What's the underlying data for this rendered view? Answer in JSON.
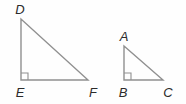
{
  "figure": {
    "background_color": "#fefefe",
    "stroke_color": "#909090",
    "label_color": "#2b2b2b",
    "stroke_width": 1.4,
    "canvas": {
      "width": 186,
      "height": 104
    },
    "triangles": [
      {
        "name": "triangle-DEF",
        "label": "Triangle DEF",
        "right_angle_at": "E",
        "vertices": [
          {
            "id": "D",
            "label": "D",
            "x": 21,
            "y": 19,
            "label_x": 20,
            "label_y": 14,
            "label_anchor": "middle"
          },
          {
            "id": "E",
            "label": "E",
            "x": 21,
            "y": 80,
            "label_x": 20,
            "label_y": 97,
            "label_anchor": "middle"
          },
          {
            "id": "F",
            "label": "F",
            "x": 88,
            "y": 80,
            "label_x": 93,
            "label_y": 97,
            "label_anchor": "middle"
          }
        ],
        "right_angle_marker": {
          "x": 21,
          "y": 80,
          "size": 7
        },
        "points": "21,19 21,80 88,80",
        "legs": {
          "vertical": 61,
          "horizontal": 67
        }
      },
      {
        "name": "triangle-ABC",
        "label": "Triangle ABC",
        "right_angle_at": "B",
        "vertices": [
          {
            "id": "A",
            "label": "A",
            "x": 124,
            "y": 46,
            "label_x": 124,
            "label_y": 41,
            "label_anchor": "middle"
          },
          {
            "id": "B",
            "label": "B",
            "x": 124,
            "y": 80,
            "label_x": 123,
            "label_y": 97,
            "label_anchor": "middle"
          },
          {
            "id": "C",
            "label": "C",
            "x": 163,
            "y": 80,
            "label_x": 168,
            "label_y": 97,
            "label_anchor": "middle"
          }
        ],
        "right_angle_marker": {
          "x": 124,
          "y": 80,
          "size": 7
        },
        "points": "124,46 124,80 163,80",
        "legs": {
          "vertical": 34,
          "horizontal": 39
        }
      }
    ]
  }
}
